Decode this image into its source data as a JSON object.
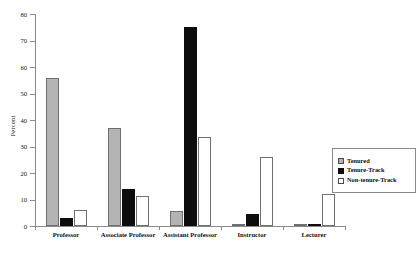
{
  "chart_data": {
    "type": "bar",
    "title": "",
    "subtitle": "",
    "xlabel": "",
    "ylabel": "Percent",
    "ylim": [
      0,
      80
    ],
    "yticks": [
      0,
      10,
      20,
      30,
      40,
      50,
      60,
      70,
      80
    ],
    "grid": false,
    "legend_position": "right",
    "categories": [
      "Professor",
      "Associate Professor",
      "Assistant Professor",
      "Instructor",
      "Lecturer"
    ],
    "series": [
      {
        "name": "Tenured",
        "color": "#b4b4b4",
        "values": [
          56,
          37,
          5.5,
          0.8,
          0.2
        ]
      },
      {
        "name": "Tenure-Track",
        "color": "#0d0d0d",
        "values": [
          3,
          14,
          75,
          4.5,
          0.5
        ]
      },
      {
        "name": "Non-tenure-Track",
        "color": "#ffffff",
        "values": [
          6,
          11.5,
          33.5,
          26,
          12
        ]
      }
    ]
  },
  "legend": {
    "items": [
      {
        "label": "Tenured",
        "swatch": "s-tenured"
      },
      {
        "label": "Tenure-Track",
        "swatch": "s-tenure-track"
      },
      {
        "label": "Non-tenure-Track",
        "swatch": "s-non-tenure"
      }
    ]
  }
}
